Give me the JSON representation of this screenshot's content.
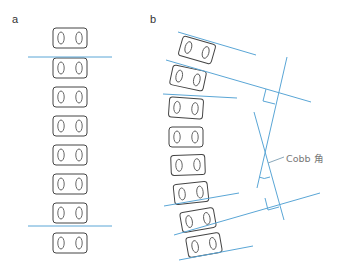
{
  "panels": {
    "a": {
      "label": "a"
    },
    "b": {
      "label": "b"
    }
  },
  "annotations": {
    "cobb_angle": "Cobb 角"
  },
  "colors": {
    "line": "#5aa6d6",
    "vertebra_stroke": "#444444",
    "label_text": "#777777"
  },
  "diagram": {
    "panel_a": {
      "description": "Straight spine, 8 vertebrae, two horizontal reference lines",
      "vertebrae_count": 8,
      "reference_lines_y": [
        57,
        226
      ]
    },
    "panel_b": {
      "description": "Scoliotic spine, 9 tilted vertebrae, endplate lines with perpendiculars forming Cobb angle",
      "vertebrae_count": 9
    }
  }
}
